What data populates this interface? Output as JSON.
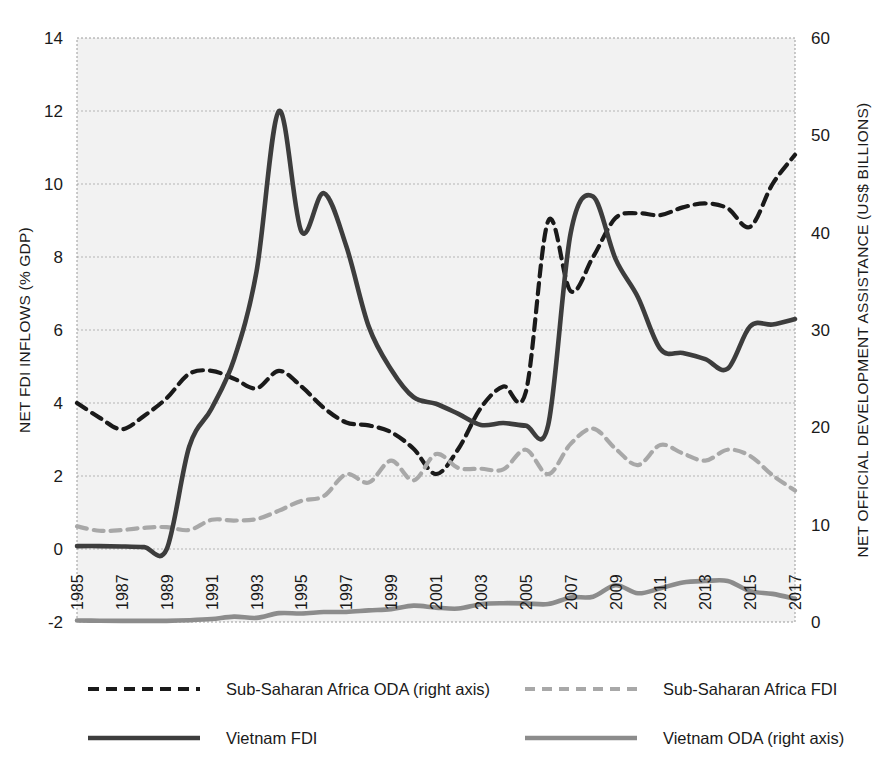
{
  "chart_data": {
    "type": "line",
    "title": "",
    "xlabel": "",
    "ylabel": "NET FDI INFLOWS (% GDP)",
    "y2label": "NET OFFICIAL DEVELOPMENT ASSISTANCE (US$ BILLIONS)",
    "grid": true,
    "legend_position": "bottom",
    "ylim": [
      -2,
      14
    ],
    "y2lim": [
      0,
      60
    ],
    "yticks": [
      "14",
      "12",
      "10",
      "8",
      "6",
      "4",
      "2",
      "0",
      "-2"
    ],
    "ytick_values": [
      14,
      12,
      10,
      8,
      6,
      4,
      2,
      0,
      -2
    ],
    "y2ticks": [
      "60",
      "50",
      "40",
      "30",
      "20",
      "10",
      "0"
    ],
    "y2tick_values": [
      60,
      50,
      40,
      30,
      20,
      10,
      0
    ],
    "x": [
      1985,
      1986,
      1987,
      1988,
      1989,
      1990,
      1991,
      1992,
      1993,
      1994,
      1995,
      1996,
      1997,
      1998,
      1999,
      2000,
      2001,
      2002,
      2003,
      2004,
      2005,
      2006,
      2007,
      2008,
      2009,
      2010,
      2011,
      2012,
      2013,
      2014,
      2015,
      2016,
      2017
    ],
    "xtick_labels": [
      "1985",
      "1987",
      "1989",
      "1991",
      "1993",
      "1995",
      "1997",
      "1999",
      "2001",
      "2003",
      "2005",
      "2007",
      "2009",
      "2011",
      "2013",
      "2015",
      "2017"
    ],
    "xtick_values": [
      1985,
      1987,
      1989,
      1991,
      1993,
      1995,
      1997,
      1999,
      2001,
      2003,
      2005,
      2007,
      2009,
      2011,
      2013,
      2015,
      2017
    ],
    "xlim": [
      1985,
      2017
    ],
    "series": [
      {
        "name": "Sub-Saharan Africa ODA (right axis)",
        "axis": "right",
        "style": "dashed",
        "color": "#1a1a1a",
        "width": 4.2,
        "dash": "11 7",
        "unit": "US$ billions",
        "values": [
          22.5,
          21.0,
          19.8,
          21.2,
          23.0,
          25.5,
          25.8,
          25.0,
          24.0,
          25.8,
          24.2,
          22.0,
          20.5,
          20.2,
          19.5,
          17.8,
          15.2,
          17.8,
          22.0,
          24.2,
          23.6,
          41.2,
          34.0,
          37.5,
          41.5,
          42.0,
          41.8,
          42.6,
          43.0,
          42.5,
          40.6,
          45.0,
          48.0
        ]
      },
      {
        "name": "Sub-Saharan Africa FDI",
        "axis": "left",
        "style": "dashed",
        "color": "#a8a8a8",
        "width": 4.2,
        "dash": "10 7",
        "unit": "% GDP",
        "values": [
          0.62,
          0.5,
          0.52,
          0.58,
          0.6,
          0.52,
          0.8,
          0.78,
          0.82,
          1.05,
          1.32,
          1.45,
          2.05,
          1.82,
          2.42,
          1.88,
          2.6,
          2.22,
          2.2,
          2.18,
          2.72,
          2.05,
          2.88,
          3.3,
          2.75,
          2.3,
          2.85,
          2.62,
          2.42,
          2.72,
          2.55,
          2.02,
          1.6
        ]
      },
      {
        "name": "Vietnam FDI",
        "axis": "left",
        "style": "solid",
        "color": "#3d3d3d",
        "width": 4.6,
        "dash": "",
        "unit": "% GDP",
        "values": [
          0.08,
          0.08,
          0.07,
          0.05,
          0.0,
          2.8,
          3.85,
          5.2,
          7.6,
          12.0,
          8.7,
          9.75,
          8.3,
          6.1,
          4.92,
          4.16,
          3.98,
          3.7,
          3.4,
          3.45,
          3.38,
          3.4,
          8.65,
          9.66,
          7.95,
          6.9,
          5.48,
          5.37,
          5.2,
          4.94,
          6.1,
          6.15,
          6.3
        ]
      },
      {
        "name": "Vietnam ODA (right axis)",
        "axis": "right",
        "style": "solid",
        "color": "#8c8c8c",
        "width": 4.6,
        "dash": "",
        "unit": "US$ billions",
        "values": [
          0.15,
          0.13,
          0.12,
          0.12,
          0.12,
          0.18,
          0.3,
          0.55,
          0.42,
          0.91,
          0.88,
          1.02,
          1.03,
          1.19,
          1.32,
          1.68,
          1.48,
          1.38,
          1.83,
          1.93,
          1.91,
          1.84,
          2.52,
          2.6,
          3.77,
          2.95,
          3.46,
          4.06,
          4.21,
          4.22,
          3.17,
          2.89,
          2.38
        ]
      }
    ]
  },
  "legend": {
    "items": [
      {
        "label": "Sub-Saharan Africa ODA (right axis)",
        "series": 0
      },
      {
        "label": "Sub-Saharan Africa FDI",
        "series": 1
      },
      {
        "label": "Vietnam FDI",
        "series": 2
      },
      {
        "label": "Vietnam ODA (right axis)",
        "series": 3
      }
    ]
  },
  "colors": {
    "dark": "#1a1a1a",
    "vietnam_fdi": "#3d3d3d",
    "light_gray": "#a8a8a8",
    "vietnam_oda": "#8c8c8c",
    "plot_background": "#f2f2f2",
    "gridline": "#b4b4b4"
  }
}
